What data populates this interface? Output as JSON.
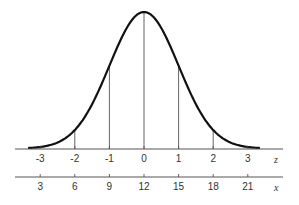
{
  "chart_data": {
    "type": "line",
    "title": "",
    "curve": {
      "distribution": "normal",
      "mean_z": 0,
      "sd_z": 1,
      "x_range_z": [
        -3.35,
        3.35
      ]
    },
    "vertical_lines_at_z": [
      -2,
      -1,
      0,
      1,
      2
    ],
    "axes": [
      {
        "name": "z",
        "label": "z",
        "ticks": [
          -3,
          -2,
          -1,
          0,
          1,
          2,
          3
        ],
        "tick_labels": [
          "-3",
          "-2",
          "-1",
          "0",
          "1",
          "2",
          "3"
        ]
      },
      {
        "name": "x",
        "label": "x",
        "ticks": [
          3,
          6,
          9,
          12,
          15,
          18,
          21
        ],
        "tick_labels": [
          "3",
          "6",
          "9",
          "12",
          "15",
          "18",
          "21"
        ]
      }
    ],
    "mapping": {
      "mean": 12,
      "sd": 3,
      "formula": "x = 12 + 3z"
    },
    "grid": false,
    "legend": null
  },
  "colors": {
    "curve": "#111111",
    "lines": "#555555",
    "text": "#333333"
  }
}
